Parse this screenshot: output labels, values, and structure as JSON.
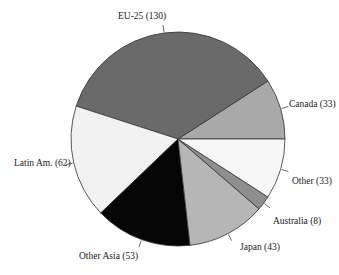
{
  "chart_data": {
    "type": "pie",
    "title": "",
    "start_angle_deg": 0,
    "direction": "counterclockwise",
    "total": 362,
    "slices": [
      {
        "label": "Canada",
        "value": 33,
        "display": "Canada (33)",
        "color": "#a9a9a9"
      },
      {
        "label": "EU-25",
        "value": 130,
        "display": "EU-25 (130)",
        "color": "#6a6a6a"
      },
      {
        "label": "Latin Am.",
        "value": 62,
        "display": "Latin Am. (62)",
        "color": "#f2f2f2"
      },
      {
        "label": "Other Asia",
        "value": 53,
        "display": "Other Asia (53)",
        "color": "#050505"
      },
      {
        "label": "Japan",
        "value": 43,
        "display": "Japan (43)",
        "color": "#b6b6b6"
      },
      {
        "label": "Australia",
        "value": 8,
        "display": "Australia (8)",
        "color": "#8e8e8e"
      },
      {
        "label": "Other",
        "value": 33,
        "display": "Other (33)",
        "color": "#f7f7f7"
      }
    ],
    "legend": "none (labels placed around pie)"
  },
  "geometry": {
    "cx": 178,
    "cy": 139,
    "r": 107
  }
}
